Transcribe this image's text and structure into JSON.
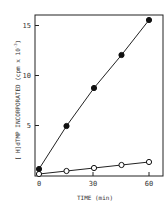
{
  "chart_data": {
    "type": "line",
    "title": "",
    "xlabel": "TIME (min)",
    "ylabel": "[3H]dTMP INCORPORATED (cpm x 10^-3)",
    "xlim": [
      -2,
      63
    ],
    "ylim": [
      0,
      16
    ],
    "x_ticks": [
      0,
      30,
      60
    ],
    "y_ticks": [
      5,
      10,
      15
    ],
    "grid": false,
    "legend": null,
    "series": [
      {
        "name": "filled circles",
        "marker": "filled-circle",
        "x": [
          0,
          15,
          30,
          45,
          60
        ],
        "y": [
          0.7,
          5.0,
          8.8,
          12.1,
          15.6
        ]
      },
      {
        "name": "open circles",
        "marker": "open-circle",
        "x": [
          0,
          15,
          30,
          45,
          60
        ],
        "y": [
          0.2,
          0.5,
          0.8,
          1.1,
          1.4
        ]
      }
    ]
  },
  "labels": {
    "x_title": "TIME (min)",
    "y_title_sup": "3",
    "y_title": "[ H]dTMP INCORPORATED (cpm x 10",
    "y_title_exp": "-3",
    "y_title_end": ")",
    "x_tick_0": "0",
    "x_tick_30": "30",
    "x_tick_60": "60",
    "y_tick_5": "5",
    "y_tick_10": "10",
    "y_tick_15": "15"
  }
}
